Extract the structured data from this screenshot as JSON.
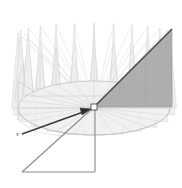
{
  "figure": {
    "background_color": "#ffffff",
    "labels": {
      "vector_label": "v"
    },
    "colors": {
      "highlight_fill": "#a8a8a8",
      "highlight_edge": "#4b4b4b",
      "spike_fill": "#ededed",
      "spike_edge": "#cfcfcf",
      "disk_fill": "#f2f2f2",
      "disk_edge": "#b8b8b8",
      "mesh_line": "#c9c9c9",
      "vector_line": "#3a3a3a",
      "base_triangle_line": "#8a8a8a",
      "apex_marker_fill": "#ffffff",
      "apex_marker_edge": "#3a3a3a"
    },
    "geometry": {
      "apex": {
        "x": 94,
        "y": 107
      },
      "disk_center": {
        "x": 94,
        "y": 108
      },
      "disk_radius_x": 76,
      "disk_radius_y": 27,
      "spike_count": 24,
      "spike_apex_y_min": 12,
      "vector_tail": {
        "x": 22,
        "y": 134
      },
      "vector_head": {
        "x": 88,
        "y": 110
      },
      "vector_label_pos": {
        "x": 18,
        "y": 134
      },
      "base_triangle": {
        "vertex_left": {
          "x": 22,
          "y": 172
        },
        "vertex_apex": {
          "x": 94,
          "y": 107
        },
        "vertex_corner": {
          "x": 95,
          "y": 172
        }
      },
      "highlight_triangle": {
        "p1": {
          "x": 94,
          "y": 107
        },
        "p2": {
          "x": 172,
          "y": 29
        },
        "p3": {
          "x": 172,
          "y": 107
        }
      }
    }
  }
}
